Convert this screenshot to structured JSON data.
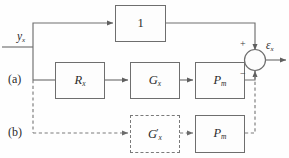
{
  "figure": {
    "type": "block-diagram",
    "width": 289,
    "height": 158,
    "background": "#fefefe",
    "line_color": "#6e6e6e",
    "text_color": "#2b2b2b"
  },
  "signals": {
    "input": {
      "base": "y",
      "sub": "x",
      "text": "y_x"
    },
    "output": {
      "base": "ε",
      "sub": "x",
      "text": "ε_x"
    }
  },
  "row_labels": [
    {
      "id": "row-a",
      "text": "(a)"
    },
    {
      "id": "row-b",
      "text": "(b)"
    }
  ],
  "blocks": [
    {
      "id": "unity",
      "base": "1",
      "sub": "",
      "prime": false,
      "style": "solid",
      "row": "feedforward"
    },
    {
      "id": "r-x",
      "base": "R",
      "sub": "x",
      "prime": false,
      "style": "solid",
      "row": "a"
    },
    {
      "id": "g-x",
      "base": "G",
      "sub": "x",
      "prime": false,
      "style": "solid",
      "row": "a"
    },
    {
      "id": "p-m-a",
      "base": "P",
      "sub": "m",
      "prime": false,
      "style": "solid",
      "row": "a"
    },
    {
      "id": "g-x-pr",
      "base": "G",
      "sub": "x",
      "prime": true,
      "style": "dashed",
      "row": "b"
    },
    {
      "id": "p-m-b",
      "base": "P",
      "sub": "m",
      "prime": false,
      "style": "solid",
      "row": "b"
    }
  ],
  "summing_junction": {
    "id": "sum",
    "shape": "circle",
    "signs": [
      {
        "id": "plus",
        "text": "+",
        "position": "top-left"
      },
      {
        "id": "minus",
        "text": "−",
        "position": "bottom-left"
      }
    ]
  },
  "connections": {
    "solid_style": "solid",
    "dashed_style": "dashed",
    "notes": "row (a) solid path, row (b) dashed path"
  }
}
